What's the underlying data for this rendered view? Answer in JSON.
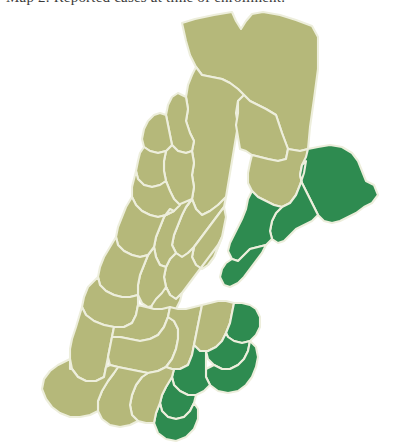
{
  "caption": {
    "text": "Map 2. Reported cases at time of enrollment."
  },
  "map": {
    "title": "New England counties choropleth",
    "background_color": "#ffffff",
    "border_color": "#edeedc",
    "legend": {
      "highlight_color": "#2e8b50",
      "base_color": "#b5b87a",
      "highlight_label": "Highlighted counties",
      "base_label": "Other counties"
    },
    "states": [
      {
        "id": "ME",
        "name": "Maine"
      },
      {
        "id": "NH",
        "name": "New Hampshire"
      },
      {
        "id": "VT",
        "name": "Vermont"
      },
      {
        "id": "MA",
        "name": "Massachusetts"
      },
      {
        "id": "CT",
        "name": "Connecticut"
      },
      {
        "id": "RI",
        "name": "Rhode Island"
      }
    ],
    "counties": [
      {
        "id": "me-aroostook-n",
        "state": "ME",
        "highlighted": false,
        "d": "M182,14 L195,10 L214,6 L232,3 L236,12 L241,20 L246,12 L252,5 L263,3 L280,6 L296,11 L312,17 L318,28 L318,60 L314,90 L310,118 L308,140 L300,142 L288,140 L282,124 L276,106 L266,100 L258,96 L250,92 L244,86 L238,80 L230,74 L222,70 L212,68 L202,66 L196,58 L190,46 L186,32 Z"
      },
      {
        "id": "me-somerset",
        "state": "ME",
        "highlighted": false,
        "d": "M196,58 L202,66 L212,68 L222,70 L230,74 L238,80 L244,86 L238,92 L236,104 L238,116 L236,128 L234,140 L232,152 L230,164 L228,176 L226,188 L218,196 L210,202 L202,206 L196,200 L192,190 L194,178 L192,166 L194,154 L192,142 L194,132 L190,124 L186,112 L188,100 L186,88 L188,76 L192,66 Z"
      },
      {
        "id": "me-piscataquis",
        "state": "ME",
        "highlighted": false,
        "d": "M244,86 L250,92 L258,96 L266,100 L276,106 L282,124 L288,140 L286,150 L278,152 L268,150 L260,148 L252,146 L246,142 L240,140 L238,128 L236,116 L238,104 L238,92 Z"
      },
      {
        "id": "me-penobscot",
        "state": "ME",
        "highlighted": false,
        "d": "M288,140 L300,142 L308,140 L306,152 L304,164 L300,176 L296,186 L290,194 L282,198 L274,196 L266,192 L258,188 L252,182 L248,174 L248,164 L250,154 L252,146 L260,148 L268,150 L278,152 L286,150 Z"
      },
      {
        "id": "me-washington",
        "state": "ME",
        "highlighted": true,
        "d": "M308,140 L318,138 L330,136 L342,138 L352,144 L358,152 L362,162 L366,172 L374,176 L378,186 L372,194 L364,198 L356,204 L348,208 L340,212 L332,214 L324,212 L318,206 L314,198 L310,190 L306,182 L302,174 L300,166 L302,156 L306,148 Z"
      },
      {
        "id": "me-hancock",
        "state": "ME",
        "highlighted": true,
        "d": "M290,194 L296,186 L300,176 L304,164 L306,152 L302,156 L300,166 L302,174 L306,182 L310,190 L314,198 L318,206 L312,212 L304,216 L296,220 L290,226 L284,232 L278,234 L272,230 L270,222 L272,212 L276,204 L282,198 Z"
      },
      {
        "id": "me-waldo-knox",
        "state": "ME",
        "highlighted": true,
        "d": "M252,182 L258,188 L266,192 L274,196 L282,198 L276,204 L272,212 L270,222 L272,230 L266,236 L258,238 L250,240 L244,246 L238,252 L232,250 L228,242 L230,234 L234,226 L238,218 L242,210 L246,200 L248,190 Z"
      },
      {
        "id": "me-sagadahoc-lincoln",
        "state": "ME",
        "highlighted": true,
        "d": "M232,250 L238,252 L244,246 L250,240 L258,238 L266,236 L262,244 L256,252 L250,260 L244,268 L238,274 L230,278 L224,276 L220,268 L222,260 L226,254 Z"
      },
      {
        "id": "me-oxford",
        "state": "ME",
        "highlighted": false,
        "d": "M192,190 L196,200 L202,206 L210,202 L218,196 L226,188 L224,198 L218,206 L212,214 L206,222 L200,230 L194,238 L188,244 L182,248 L176,244 L172,236 L174,226 L178,216 L182,206 L186,198 Z"
      },
      {
        "id": "me-androscoggin",
        "state": "ME",
        "highlighted": false,
        "d": "M194,238 L200,230 L206,222 L212,214 L218,206 L224,198 L226,208 L224,218 L222,228 L218,238 L214,248 L208,256 L202,260 L196,256 L192,248 Z"
      },
      {
        "id": "me-cumberland-york",
        "state": "ME",
        "highlighted": false,
        "d": "M176,244 L182,248 L188,244 L194,238 L192,248 L196,256 L202,260 L208,256 L214,248 L218,238 L222,228 L218,236 L212,244 L206,252 L200,260 L194,268 L188,276 L182,284 L176,290 L170,286 L166,278 L164,268 L166,258 L170,250 Z"
      },
      {
        "id": "nh-coos",
        "state": "NH",
        "highlighted": false,
        "d": "M186,88 L188,100 L186,112 L190,124 L194,132 L192,142 L186,144 L178,142 L172,136 L170,126 L168,116 L166,106 L168,96 L172,88 L178,84 Z"
      },
      {
        "id": "nh-grafton",
        "state": "NH",
        "highlighted": false,
        "d": "M172,136 L178,142 L186,144 L192,142 L194,154 L192,166 L194,178 L192,190 L186,198 L180,196 L174,190 L170,182 L166,172 L164,162 L164,152 L166,142 Z"
      },
      {
        "id": "nh-carroll-belknap",
        "state": "NH",
        "highlighted": false,
        "d": "M192,190 L186,198 L182,206 L178,216 L174,226 L172,236 L176,244 L170,250 L166,258 L160,256 L156,248 L154,238 L156,228 L160,218 L164,208 L170,200 L178,196 Z"
      },
      {
        "id": "nh-merrimack-hillsboro",
        "state": "NH",
        "highlighted": false,
        "d": "M154,238 L156,248 L160,256 L166,258 L164,268 L166,278 L170,286 L164,292 L156,296 L148,298 L142,294 L138,286 L138,276 L140,266 L144,256 L148,246 Z"
      },
      {
        "id": "nh-rockingham-strafford",
        "state": "NH",
        "highlighted": false,
        "d": "M166,278 L170,286 L176,290 L182,284 L180,292 L176,300 L172,308 L166,314 L158,316 L152,312 L150,304 L152,296 L156,290 L162,284 Z"
      },
      {
        "id": "vt-essex-orleans",
        "state": "VT",
        "highlighted": false,
        "d": "M166,106 L168,116 L170,126 L172,136 L166,142 L158,144 L150,142 L144,138 L142,130 L144,120 L148,112 L154,106 L160,104 Z"
      },
      {
        "id": "vt-caledonia-washington",
        "state": "VT",
        "highlighted": false,
        "d": "M144,138 L150,142 L158,144 L166,142 L164,152 L164,162 L166,172 L160,176 L152,178 L144,176 L138,170 L136,162 L138,152 L140,144 Z"
      },
      {
        "id": "vt-lamoille-chittenden",
        "state": "VT",
        "highlighted": false,
        "d": "M136,162 L138,170 L144,176 L152,178 L160,176 L166,172 L170,182 L174,190 L180,196 L174,202 L166,206 L158,208 L150,206 L142,202 L136,196 L132,188 L132,178 L134,170 Z"
      },
      {
        "id": "vt-addison-orange",
        "state": "VT",
        "highlighted": false,
        "d": "M132,188 L136,196 L142,202 L150,206 L158,208 L166,206 L174,202 L170,200 L164,208 L160,218 L156,228 L154,238 L148,246 L140,248 L132,246 L124,242 L118,236 L116,228 L118,218 L122,208 L126,198 Z"
      },
      {
        "id": "vt-rutland-windsor",
        "state": "VT",
        "highlighted": false,
        "d": "M116,228 L118,236 L124,242 L132,246 L140,248 L148,246 L144,256 L140,266 L138,276 L138,286 L130,288 L122,288 L114,286 L106,282 L100,276 L98,268 L100,258 L104,248 L110,238 Z"
      },
      {
        "id": "vt-bennington-windham",
        "state": "VT",
        "highlighted": false,
        "d": "M98,268 L100,276 L106,282 L114,286 L122,288 L130,288 L138,286 L138,296 L136,306 L132,314 L124,318 L114,318 L104,316 L94,312 L86,306 L82,298 L84,288 L88,278 Z"
      },
      {
        "id": "ma-berkshire",
        "state": "MA",
        "highlighted": false,
        "d": "M82,298 L86,306 L94,312 L104,316 L114,318 L112,328 L110,338 L108,348 L106,358 L104,368 L96,372 L86,372 L78,368 L72,360 L70,350 L70,340 L72,330 L76,318 Z"
      },
      {
        "id": "ma-franklin",
        "state": "MA",
        "highlighted": false,
        "d": "M114,318 L124,318 L132,314 L136,306 L138,296 L146,298 L154,300 L162,300 L170,298 L168,308 L164,318 L158,326 L150,330 L140,332 L130,330 L120,328 L112,328 Z"
      },
      {
        "id": "ma-hampshire-hampden",
        "state": "MA",
        "highlighted": false,
        "d": "M112,328 L120,328 L130,330 L140,332 L150,330 L158,326 L164,318 L168,308 L174,312 L178,320 L178,330 L176,340 L172,350 L166,358 L158,362 L148,364 L138,362 L128,360 L118,358 L110,356 L108,348 L110,338 Z"
      },
      {
        "id": "ma-worcester",
        "state": "MA",
        "highlighted": false,
        "d": "M170,298 L178,300 L186,300 L194,298 L202,296 L200,306 L198,316 L196,326 L194,336 L192,346 L188,356 L180,360 L172,360 L166,358 L172,350 L176,340 L178,330 L178,320 L174,312 L168,308 Z"
      },
      {
        "id": "ma-middlesex",
        "state": "MA",
        "highlighted": false,
        "d": "M202,296 L210,294 L218,292 L226,292 L234,294 L232,304 L230,314 L226,324 L222,332 L216,338 L208,342 L200,342 L194,336 L196,326 L198,316 L200,306 Z"
      },
      {
        "id": "ma-essex",
        "state": "MA",
        "highlighted": true,
        "d": "M234,294 L242,294 L250,296 L256,300 L260,308 L260,318 L256,326 L250,332 L242,334 L234,332 L228,328 L226,324 L230,314 L232,304 Z"
      },
      {
        "id": "ma-suffolk-norfolk",
        "state": "MA",
        "highlighted": true,
        "d": "M226,324 L228,328 L234,332 L242,334 L250,332 L248,342 L244,350 L238,356 L230,360 L222,360 L214,356 L208,350 L206,342 L208,342 L216,338 L222,332 Z"
      },
      {
        "id": "ma-plymouth",
        "state": "MA",
        "highlighted": true,
        "d": "M222,360 L230,360 L238,356 L244,350 L248,342 L250,332 L256,338 L258,348 L256,358 L252,368 L246,376 L238,382 L228,384 L218,382 L210,376 L206,368 L206,360 L214,356 Z"
      },
      {
        "id": "ma-bristol",
        "state": "MA",
        "highlighted": true,
        "d": "M188,356 L192,346 L194,336 L200,342 L208,342 L206,342 L206,350 L206,360 L206,368 L210,376 L204,382 L196,386 L188,386 L180,382 L174,376 L172,368 L174,360 L180,360 Z"
      },
      {
        "id": "ri-providence",
        "state": "RI",
        "highlighted": true,
        "d": "M172,368 L174,376 L180,382 L188,386 L196,386 L194,394 L190,402 L184,408 L176,410 L168,408 L162,402 L160,394 L162,386 L166,378 Z"
      },
      {
        "id": "ri-newport-washington",
        "state": "RI",
        "highlighted": true,
        "d": "M160,394 L162,402 L168,408 L176,410 L184,408 L190,402 L194,394 L198,400 L198,410 L194,420 L186,428 L176,432 L166,430 L158,424 L154,414 L156,404 Z"
      },
      {
        "id": "ct-windham-tolland",
        "state": "CT",
        "highlighted": false,
        "d": "M148,364 L158,362 L166,358 L172,360 L174,360 L172,368 L166,378 L162,386 L160,394 L156,404 L154,414 L146,414 L138,412 L132,406 L130,396 L132,386 L136,376 L142,368 Z"
      },
      {
        "id": "ct-hartford-new-london",
        "state": "CT",
        "highlighted": false,
        "d": "M118,358 L128,360 L138,362 L148,364 L142,368 L136,376 L132,386 L130,396 L132,406 L138,412 L130,416 L120,418 L110,416 L102,410 L98,402 L98,392 L102,382 L108,372 L114,364 Z"
      },
      {
        "id": "ct-new-haven-fairfield",
        "state": "CT",
        "highlighted": false,
        "d": "M70,350 L70,360 L72,360 L78,368 L86,372 L96,372 L104,368 L106,358 L110,356 L118,358 L114,364 L108,372 L102,382 L98,392 L98,402 L90,406 L80,408 L70,408 L60,404 L52,398 L46,390 L42,380 L44,370 L50,362 L58,356 Z"
      }
    ]
  }
}
